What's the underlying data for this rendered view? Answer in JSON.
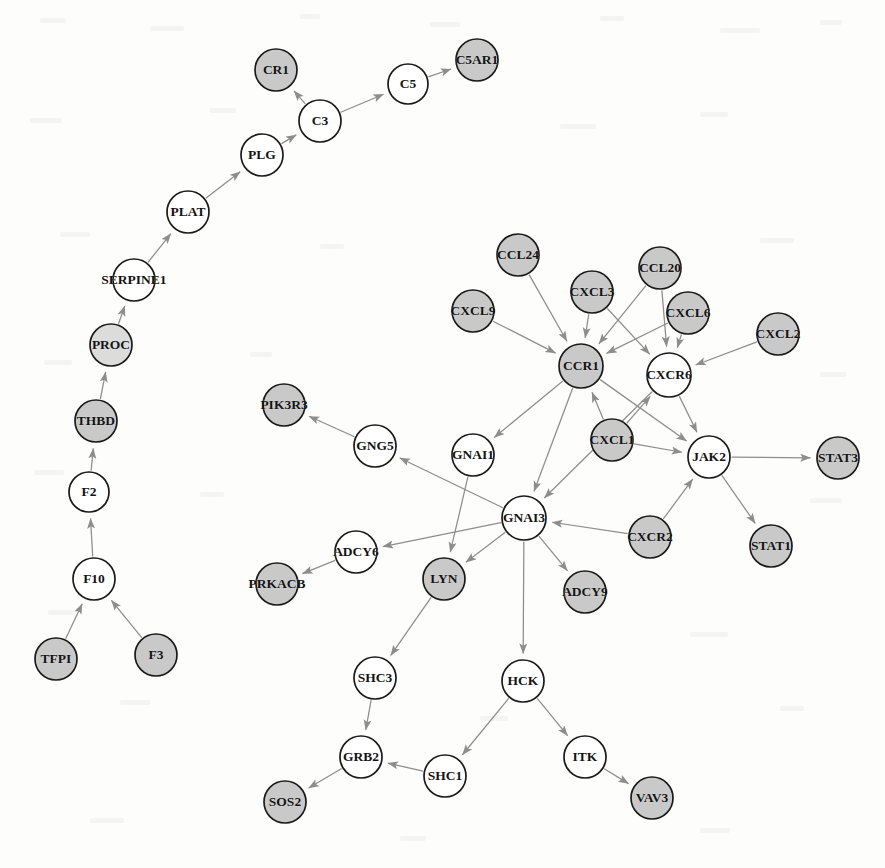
{
  "figure": {
    "width": 885,
    "height": 868,
    "background_color": "#fdfdfc",
    "edge_color": "#8d8d8d",
    "node_stroke_color": "#1a1a1a",
    "label_color": "#141414"
  },
  "legend": {
    "fill_gray": "#c9c9c9",
    "fill_gray_light": "#dcdcdc",
    "fill_white": "#ffffff"
  },
  "chart_data": {
    "type": "diagram",
    "graph_kind": "directed-node-link",
    "node_count": 41,
    "edge_count": 44,
    "nodes": [
      {
        "id": "CR1",
        "label": "CR1",
        "x": 276,
        "y": 70,
        "r": 21,
        "fill": "#c9c9c9"
      },
      {
        "id": "C5",
        "label": "C5",
        "x": 408,
        "y": 84,
        "r": 20,
        "fill": "#ffffff"
      },
      {
        "id": "C5AR1",
        "label": "C5AR1",
        "x": 477,
        "y": 60,
        "r": 21,
        "fill": "#c9c9c9"
      },
      {
        "id": "C3",
        "label": "C3",
        "x": 320,
        "y": 121,
        "r": 21,
        "fill": "#ffffff"
      },
      {
        "id": "PLG",
        "label": "PLG",
        "x": 262,
        "y": 155,
        "r": 21,
        "fill": "#ffffff"
      },
      {
        "id": "PLAT",
        "label": "PLAT",
        "x": 188,
        "y": 212,
        "r": 21,
        "fill": "#ffffff"
      },
      {
        "id": "SERPINE1",
        "label": "SERPINE1",
        "x": 134,
        "y": 280,
        "r": 21,
        "fill": "#ffffff"
      },
      {
        "id": "PROC",
        "label": "PROC",
        "x": 111,
        "y": 345,
        "r": 21,
        "fill": "#dcdcdc"
      },
      {
        "id": "THBD",
        "label": "THBD",
        "x": 96,
        "y": 421,
        "r": 21,
        "fill": "#c9c9c9"
      },
      {
        "id": "F2",
        "label": "F2",
        "x": 89,
        "y": 492,
        "r": 20,
        "fill": "#ffffff"
      },
      {
        "id": "F10",
        "label": "F10",
        "x": 94,
        "y": 579,
        "r": 21,
        "fill": "#ffffff"
      },
      {
        "id": "TFPI",
        "label": "TFPI",
        "x": 56,
        "y": 659,
        "r": 21,
        "fill": "#c9c9c9"
      },
      {
        "id": "F3",
        "label": "F3",
        "x": 156,
        "y": 655,
        "r": 21,
        "fill": "#c9c9c9"
      },
      {
        "id": "CCL24",
        "label": "CCL24",
        "x": 518,
        "y": 255,
        "r": 21,
        "fill": "#c9c9c9"
      },
      {
        "id": "CXCL3",
        "label": "CXCL3",
        "x": 592,
        "y": 292,
        "r": 21,
        "fill": "#c9c9c9"
      },
      {
        "id": "CCL20",
        "label": "CCL20",
        "x": 660,
        "y": 268,
        "r": 21,
        "fill": "#c9c9c9"
      },
      {
        "id": "CXCL9",
        "label": "CXCL9",
        "x": 473,
        "y": 311,
        "r": 21,
        "fill": "#c9c9c9"
      },
      {
        "id": "CXCL6",
        "label": "CXCL6",
        "x": 688,
        "y": 313,
        "r": 21,
        "fill": "#c9c9c9"
      },
      {
        "id": "CXCL2",
        "label": "CXCL2",
        "x": 778,
        "y": 334,
        "r": 21,
        "fill": "#c9c9c9"
      },
      {
        "id": "CCR1",
        "label": "CCR1",
        "x": 581,
        "y": 366,
        "r": 22,
        "fill": "#c9c9c9"
      },
      {
        "id": "CXCR6",
        "label": "CXCR6",
        "x": 669,
        "y": 375,
        "r": 22,
        "fill": "#ffffff"
      },
      {
        "id": "PIK3R3",
        "label": "PIK3R3",
        "x": 284,
        "y": 405,
        "r": 21,
        "fill": "#c9c9c9"
      },
      {
        "id": "GNG5",
        "label": "GNG5",
        "x": 375,
        "y": 446,
        "r": 21,
        "fill": "#ffffff"
      },
      {
        "id": "GNAI1",
        "label": "GNAI1",
        "x": 473,
        "y": 455,
        "r": 21,
        "fill": "#ffffff"
      },
      {
        "id": "CXCL1",
        "label": "CXCL1",
        "x": 612,
        "y": 440,
        "r": 21,
        "fill": "#c9c9c9"
      },
      {
        "id": "JAK2",
        "label": "JAK2",
        "x": 709,
        "y": 457,
        "r": 21,
        "fill": "#ffffff"
      },
      {
        "id": "STAT3",
        "label": "STAT3",
        "x": 838,
        "y": 458,
        "r": 21,
        "fill": "#c9c9c9"
      },
      {
        "id": "GNAI3",
        "label": "GNAI3",
        "x": 524,
        "y": 518,
        "r": 22,
        "fill": "#ffffff"
      },
      {
        "id": "CXCR2",
        "label": "CXCR2",
        "x": 650,
        "y": 537,
        "r": 21,
        "fill": "#c9c9c9"
      },
      {
        "id": "STAT1",
        "label": "STAT1",
        "x": 771,
        "y": 546,
        "r": 21,
        "fill": "#c9c9c9"
      },
      {
        "id": "ADCY6",
        "label": "ADCY6",
        "x": 356,
        "y": 552,
        "r": 21,
        "fill": "#ffffff"
      },
      {
        "id": "PRKACB",
        "label": "PRKACB",
        "x": 277,
        "y": 584,
        "r": 21,
        "fill": "#c9c9c9"
      },
      {
        "id": "LYN",
        "label": "LYN",
        "x": 444,
        "y": 579,
        "r": 21,
        "fill": "#c9c9c9"
      },
      {
        "id": "ADCY9",
        "label": "ADCY9",
        "x": 585,
        "y": 592,
        "r": 21,
        "fill": "#c9c9c9"
      },
      {
        "id": "SHC3",
        "label": "SHC3",
        "x": 375,
        "y": 678,
        "r": 21,
        "fill": "#ffffff"
      },
      {
        "id": "HCK",
        "label": "HCK",
        "x": 523,
        "y": 681,
        "r": 21,
        "fill": "#ffffff"
      },
      {
        "id": "ITK",
        "label": "ITK",
        "x": 585,
        "y": 757,
        "r": 21,
        "fill": "#ffffff"
      },
      {
        "id": "GRB2",
        "label": "GRB2",
        "x": 361,
        "y": 757,
        "r": 21,
        "fill": "#ffffff"
      },
      {
        "id": "SHC1",
        "label": "SHC1",
        "x": 445,
        "y": 776,
        "r": 21,
        "fill": "#ffffff"
      },
      {
        "id": "VAV3",
        "label": "VAV3",
        "x": 652,
        "y": 798,
        "r": 21,
        "fill": "#c9c9c9"
      },
      {
        "id": "SOS2",
        "label": "SOS2",
        "x": 285,
        "y": 802,
        "r": 21,
        "fill": "#c9c9c9"
      }
    ],
    "edges": [
      {
        "source": "C3",
        "target": "CR1"
      },
      {
        "source": "C3",
        "target": "C5"
      },
      {
        "source": "C5",
        "target": "C5AR1"
      },
      {
        "source": "PLG",
        "target": "C3"
      },
      {
        "source": "PLAT",
        "target": "PLG"
      },
      {
        "source": "SERPINE1",
        "target": "PLAT"
      },
      {
        "source": "PROC",
        "target": "SERPINE1"
      },
      {
        "source": "THBD",
        "target": "PROC"
      },
      {
        "source": "F2",
        "target": "THBD"
      },
      {
        "source": "F10",
        "target": "F2"
      },
      {
        "source": "TFPI",
        "target": "F10"
      },
      {
        "source": "F3",
        "target": "F10"
      },
      {
        "source": "CCL24",
        "target": "CCR1"
      },
      {
        "source": "CXCL3",
        "target": "CCR1"
      },
      {
        "source": "CXCL9",
        "target": "CCR1"
      },
      {
        "source": "CCL20",
        "target": "CCR1"
      },
      {
        "source": "CCL20",
        "target": "CXCR6"
      },
      {
        "source": "CXCL6",
        "target": "CCR1"
      },
      {
        "source": "CXCL6",
        "target": "CXCR6"
      },
      {
        "source": "CXCL3",
        "target": "CXCR6"
      },
      {
        "source": "CXCL2",
        "target": "CXCR6"
      },
      {
        "source": "CXCL1",
        "target": "CCR1"
      },
      {
        "source": "CXCL1",
        "target": "CXCR6"
      },
      {
        "source": "CXCL1",
        "target": "JAK2"
      },
      {
        "source": "CCR1",
        "target": "GNAI1"
      },
      {
        "source": "CCR1",
        "target": "GNAI3"
      },
      {
        "source": "CCR1",
        "target": "JAK2"
      },
      {
        "source": "CXCR6",
        "target": "GNAI3"
      },
      {
        "source": "CXCR6",
        "target": "JAK2"
      },
      {
        "source": "CXCR2",
        "target": "JAK2"
      },
      {
        "source": "CXCR2",
        "target": "GNAI3"
      },
      {
        "source": "JAK2",
        "target": "STAT3"
      },
      {
        "source": "JAK2",
        "target": "STAT1"
      },
      {
        "source": "GNAI1",
        "target": "LYN"
      },
      {
        "source": "GNAI3",
        "target": "GNG5"
      },
      {
        "source": "GNG5",
        "target": "PIK3R3"
      },
      {
        "source": "GNAI3",
        "target": "ADCY6"
      },
      {
        "source": "ADCY6",
        "target": "PRKACB"
      },
      {
        "source": "GNAI3",
        "target": "LYN"
      },
      {
        "source": "GNAI3",
        "target": "ADCY9"
      },
      {
        "source": "GNAI3",
        "target": "HCK"
      },
      {
        "source": "LYN",
        "target": "SHC3"
      },
      {
        "source": "SHC3",
        "target": "GRB2"
      },
      {
        "source": "GRB2",
        "target": "SOS2"
      },
      {
        "source": "SHC1",
        "target": "GRB2"
      },
      {
        "source": "HCK",
        "target": "SHC1"
      },
      {
        "source": "HCK",
        "target": "ITK"
      },
      {
        "source": "ITK",
        "target": "VAV3"
      }
    ]
  }
}
